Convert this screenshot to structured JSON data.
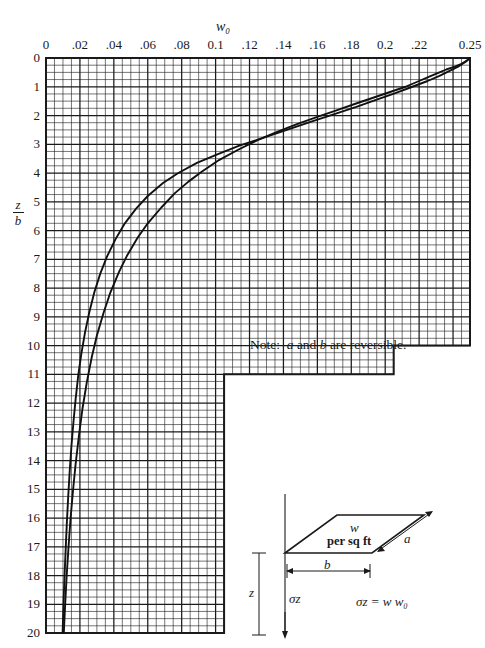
{
  "figure": {
    "top_axis_title": "w₀",
    "y_axis_label_numerator": "z",
    "y_axis_label_denominator": "b",
    "note_prefix": "Note:",
    "note_a": "a",
    "note_mid": "and",
    "note_b": "b",
    "note_suffix": "are reversible."
  },
  "diagram": {
    "load_label_line1": "w",
    "load_label_line2": "per sq ft",
    "side_a_label": "a",
    "side_b_label": "b",
    "depth_label": "z",
    "stress_label": "σz",
    "formula": "σz = w w₀"
  },
  "chart_data": {
    "type": "line",
    "title": "w₀",
    "xlabel": "w₀",
    "ylabel": "z/b",
    "grid": true,
    "legend": "none",
    "xlim": [
      0,
      0.25
    ],
    "ylim": [
      20,
      0
    ],
    "y_axis_inverted": true,
    "x_major_step": 0.02,
    "x_minor_step": 0.005,
    "y_major_step": 1,
    "y_minor_step": 0.25,
    "xticks": [
      "0",
      ".02",
      ".04",
      ".06",
      ".08",
      "0.1",
      ".12",
      ".14",
      ".16",
      ".18",
      "0.2",
      ".22",
      "0.25"
    ],
    "xtick_values": [
      0,
      0.02,
      0.04,
      0.06,
      0.08,
      0.1,
      0.12,
      0.14,
      0.16,
      0.18,
      0.2,
      0.22,
      0.25
    ],
    "yticks": [
      "0",
      "1",
      "2",
      "3",
      "4",
      "5",
      "6",
      "7",
      "8",
      "9",
      "10",
      "11",
      "12",
      "13",
      "14",
      "15",
      "16",
      "17",
      "18",
      "19",
      "20"
    ],
    "ytick_values": [
      0,
      1,
      2,
      3,
      4,
      5,
      6,
      7,
      8,
      9,
      10,
      11,
      12,
      13,
      14,
      15,
      16,
      17,
      18,
      19,
      20
    ],
    "grid_extent_by_depth": [
      {
        "from_y": 0,
        "to_y": 10,
        "x_max": 0.25
      },
      {
        "from_y": 10,
        "to_y": 11,
        "x_max": 0.205
      },
      {
        "from_y": 11,
        "to_y": 20,
        "x_max": 0.105
      }
    ],
    "series": [
      {
        "name": "a/b = 1 (square)",
        "points": [
          [
            0.25,
            0.0
          ],
          [
            0.248,
            0.1
          ],
          [
            0.245,
            0.2
          ],
          [
            0.241,
            0.3
          ],
          [
            0.236,
            0.4
          ],
          [
            0.232,
            0.5
          ],
          [
            0.226,
            0.65
          ],
          [
            0.22,
            0.8
          ],
          [
            0.212,
            1.0
          ],
          [
            0.202,
            1.2
          ],
          [
            0.192,
            1.4
          ],
          [
            0.182,
            1.6
          ],
          [
            0.17,
            1.85
          ],
          [
            0.16,
            2.05
          ],
          [
            0.148,
            2.3
          ],
          [
            0.137,
            2.55
          ],
          [
            0.125,
            2.85
          ],
          [
            0.113,
            3.2
          ],
          [
            0.102,
            3.55
          ],
          [
            0.092,
            3.95
          ],
          [
            0.084,
            4.3
          ],
          [
            0.076,
            4.7
          ],
          [
            0.068,
            5.2
          ],
          [
            0.06,
            5.75
          ],
          [
            0.054,
            6.25
          ],
          [
            0.048,
            6.85
          ],
          [
            0.043,
            7.45
          ],
          [
            0.038,
            8.15
          ],
          [
            0.034,
            8.85
          ],
          [
            0.03,
            9.65
          ],
          [
            0.027,
            10.4
          ],
          [
            0.024,
            11.3
          ],
          [
            0.0215,
            12.2
          ],
          [
            0.0195,
            13.1
          ],
          [
            0.0175,
            14.1
          ],
          [
            0.016,
            15.0
          ],
          [
            0.0145,
            16.0
          ],
          [
            0.0133,
            17.0
          ],
          [
            0.0122,
            18.0
          ],
          [
            0.0113,
            19.0
          ],
          [
            0.0105,
            20.0
          ]
        ]
      },
      {
        "name": "a/b = ∞ (strip)",
        "points": [
          [
            0.25,
            0.0
          ],
          [
            0.247,
            0.15
          ],
          [
            0.243,
            0.3
          ],
          [
            0.238,
            0.45
          ],
          [
            0.232,
            0.62
          ],
          [
            0.225,
            0.8
          ],
          [
            0.216,
            1.0
          ],
          [
            0.206,
            1.22
          ],
          [
            0.195,
            1.45
          ],
          [
            0.183,
            1.7
          ],
          [
            0.17,
            1.95
          ],
          [
            0.156,
            2.22
          ],
          [
            0.142,
            2.5
          ],
          [
            0.128,
            2.78
          ],
          [
            0.114,
            3.05
          ],
          [
            0.101,
            3.35
          ],
          [
            0.089,
            3.65
          ],
          [
            0.078,
            4.0
          ],
          [
            0.069,
            4.35
          ],
          [
            0.06,
            4.8
          ],
          [
            0.053,
            5.25
          ],
          [
            0.0465,
            5.75
          ],
          [
            0.041,
            6.3
          ],
          [
            0.036,
            6.9
          ],
          [
            0.032,
            7.5
          ],
          [
            0.0285,
            8.15
          ],
          [
            0.0255,
            8.85
          ],
          [
            0.023,
            9.55
          ],
          [
            0.0208,
            10.3
          ],
          [
            0.019,
            11.05
          ],
          [
            0.0175,
            11.85
          ],
          [
            0.0162,
            12.65
          ],
          [
            0.015,
            13.5
          ],
          [
            0.014,
            14.35
          ],
          [
            0.0131,
            15.25
          ],
          [
            0.0123,
            16.15
          ],
          [
            0.0116,
            17.1
          ],
          [
            0.0109,
            18.05
          ],
          [
            0.0103,
            19.0
          ],
          [
            0.0098,
            20.0
          ]
        ]
      }
    ]
  }
}
